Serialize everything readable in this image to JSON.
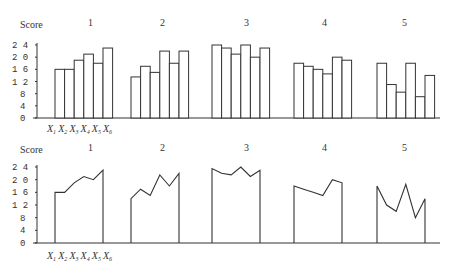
{
  "chart_data": [
    {
      "type": "bar",
      "title": "",
      "ylabel": "Score",
      "ylim": [
        0,
        24
      ],
      "yticks": [
        0,
        4,
        8,
        12,
        16,
        20,
        24
      ],
      "panels": [
        "1",
        "2",
        "3",
        "4",
        "5"
      ],
      "categories": [
        "X1",
        "X2",
        "X3",
        "X4",
        "X5",
        "X6"
      ],
      "series": [
        {
          "name": "1",
          "values": [
            16,
            16,
            19,
            21,
            18,
            23
          ]
        },
        {
          "name": "2",
          "values": [
            13.5,
            17,
            15,
            22,
            18,
            22
          ]
        },
        {
          "name": "3",
          "values": [
            24,
            23,
            21,
            24,
            20,
            23
          ]
        },
        {
          "name": "4",
          "values": [
            18,
            17,
            16,
            14.5,
            20,
            19
          ]
        },
        {
          "name": "5",
          "values": [
            18,
            11,
            8.5,
            18,
            7,
            14
          ]
        }
      ],
      "grid": false,
      "legend": "none"
    },
    {
      "type": "line",
      "title": "",
      "ylabel": "Score",
      "ylim": [
        0,
        24
      ],
      "yticks": [
        0,
        4,
        8,
        12,
        16,
        20,
        24
      ],
      "panels": [
        "1",
        "2",
        "3",
        "4",
        "5"
      ],
      "categories": [
        "X1",
        "X2",
        "X3",
        "X4",
        "X5",
        "X6"
      ],
      "series": [
        {
          "name": "1",
          "values": [
            16,
            16,
            19,
            21,
            20,
            23
          ]
        },
        {
          "name": "2",
          "values": [
            14,
            17,
            15,
            21.5,
            18,
            22
          ]
        },
        {
          "name": "3",
          "values": [
            23.5,
            22,
            21.5,
            24,
            21,
            23
          ]
        },
        {
          "name": "4",
          "values": [
            18,
            17,
            16,
            15,
            20,
            19
          ]
        },
        {
          "name": "5",
          "values": [
            18,
            12,
            10,
            18.5,
            8,
            14
          ]
        }
      ],
      "grid": false,
      "legend": "none"
    }
  ],
  "labels": {
    "score": "Score",
    "x1": "X",
    "x_subs": [
      "1",
      "2",
      "3",
      "4",
      "5",
      "6"
    ]
  }
}
